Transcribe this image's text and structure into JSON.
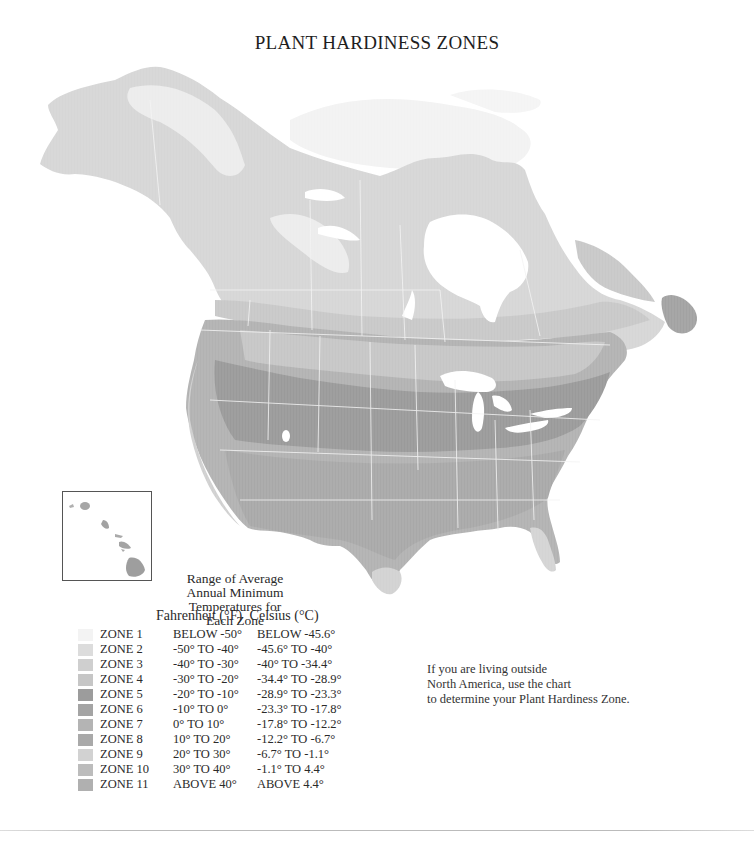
{
  "title": "PLANT HARDINESS ZONES",
  "caption": {
    "lines": [
      "Range of Average",
      "Annual Minimum",
      "Temperatures for",
      "Each Zone"
    ]
  },
  "units": {
    "fahrenheit": "Fahrenheit (°F)",
    "celsius": "Celsius (°C)"
  },
  "legend": [
    {
      "zone": "ZONE 1",
      "fahrenheit": "BELOW -50°",
      "celsius": "BELOW -45.6°",
      "color": "#f3f3f3"
    },
    {
      "zone": "ZONE 2",
      "fahrenheit": "-50° TO -40°",
      "celsius": "-45.6° TO -40°",
      "color": "#dcdcdc"
    },
    {
      "zone": "ZONE 3",
      "fahrenheit": "-40° TO -30°",
      "celsius": "-40° TO -34.4°",
      "color": "#cfcfcf"
    },
    {
      "zone": "ZONE 4",
      "fahrenheit": "-30° TO -20°",
      "celsius": "-34.4° TO -28.9°",
      "color": "#c6c6c6"
    },
    {
      "zone": "ZONE 5",
      "fahrenheit": "-20° TO -10°",
      "celsius": "-28.9° TO -23.3°",
      "color": "#9c9c9c"
    },
    {
      "zone": "ZONE 6",
      "fahrenheit": "-10° TO    0°",
      "celsius": "-23.3° TO -17.8°",
      "color": "#a4a4a4"
    },
    {
      "zone": "ZONE 7",
      "fahrenheit": "0° TO  10°",
      "celsius": "-17.8° TO -12.2°",
      "color": "#b4b4b4"
    },
    {
      "zone": "ZONE 8",
      "fahrenheit": "10° TO  20°",
      "celsius": "-12.2° TO -6.7°",
      "color": "#a9a9a9"
    },
    {
      "zone": "ZONE 9",
      "fahrenheit": "20° TO  30°",
      "celsius": "-6.7° TO -1.1°",
      "color": "#d2d2d2"
    },
    {
      "zone": "ZONE 10",
      "fahrenheit": "30° TO  40°",
      "celsius": "-1.1° TO 4.4°",
      "color": "#bcbcbc"
    },
    {
      "zone": "ZONE 11",
      "fahrenheit": "ABOVE 40°",
      "celsius": "ABOVE 4.4°",
      "color": "#b0b0b0"
    }
  ],
  "note": {
    "lines": [
      "If you are living outside",
      "North America, use the chart",
      "to determine your Plant Hardiness Zone."
    ]
  },
  "map": {
    "region": "North America",
    "inset": "Hawaii",
    "colors": {
      "arctic": "#f1f1f1",
      "canada_north": "#dddddd",
      "canada_mid": "#d0d0d0",
      "canada_south": "#c4c4c4",
      "us_north": "#c9c9c9",
      "us_mid": "#9d9d9d",
      "us_south": "#a8a8a8",
      "coast": "#cfcfcf",
      "water": "#ffffff",
      "border": "#f4f4f4"
    }
  }
}
